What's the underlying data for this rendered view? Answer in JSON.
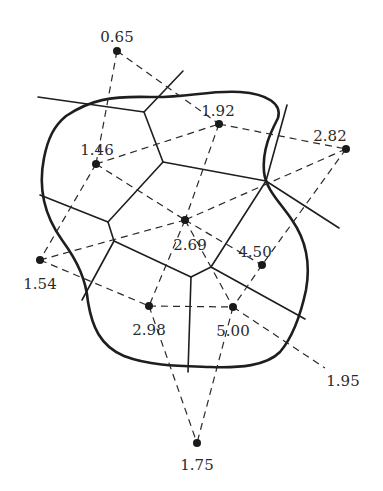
{
  "diagram": {
    "type": "voronoi-thiessen-polygons",
    "points": [
      {
        "id": "p065",
        "label": "0.65",
        "x": 117,
        "y": 51,
        "lx": 117,
        "ly": 38,
        "anchor": "middle"
      },
      {
        "id": "p192",
        "label": "1.92",
        "x": 219,
        "y": 124,
        "lx": 218,
        "ly": 112,
        "anchor": "middle"
      },
      {
        "id": "p282",
        "label": "2.82",
        "x": 346,
        "y": 149,
        "lx": 330,
        "ly": 137,
        "anchor": "middle"
      },
      {
        "id": "p146",
        "label": "1.46",
        "x": 96,
        "y": 164,
        "lx": 97,
        "ly": 151,
        "anchor": "middle"
      },
      {
        "id": "p269",
        "label": "2.69",
        "x": 185,
        "y": 220,
        "lx": 190,
        "ly": 246,
        "anchor": "middle"
      },
      {
        "id": "p154",
        "label": "1.54",
        "x": 40,
        "y": 260,
        "lx": 40,
        "ly": 285,
        "anchor": "middle"
      },
      {
        "id": "p450",
        "label": "4.50",
        "x": 262,
        "y": 265,
        "lx": 255,
        "ly": 253,
        "anchor": "middle"
      },
      {
        "id": "p298",
        "label": "2.98",
        "x": 149,
        "y": 306,
        "lx": 149,
        "ly": 331,
        "anchor": "middle"
      },
      {
        "id": "p500",
        "label": "5.00",
        "x": 233,
        "y": 307,
        "lx": 233,
        "ly": 332,
        "anchor": "middle"
      },
      {
        "id": "p195",
        "label": "1.95",
        "x": 325,
        "y": 368,
        "lx": 343,
        "ly": 382,
        "anchor": "middle"
      },
      {
        "id": "p175",
        "label": "1.75",
        "x": 197,
        "y": 443,
        "lx": 197,
        "ly": 466,
        "anchor": "middle"
      }
    ],
    "triangulation_edges": [
      [
        "p065",
        "p146"
      ],
      [
        "p065",
        "p192"
      ],
      [
        "p146",
        "p192"
      ],
      [
        "p146",
        "p269"
      ],
      [
        "p146",
        "p154"
      ],
      [
        "p192",
        "p282"
      ],
      [
        "p192",
        "p269"
      ],
      [
        "p282",
        "p269"
      ],
      [
        "p282",
        "p450"
      ],
      [
        "p154",
        "p269"
      ],
      [
        "p154",
        "p298"
      ],
      [
        "p269",
        "p298"
      ],
      [
        "p269",
        "p450"
      ],
      [
        "p269",
        "p500"
      ],
      [
        "p298",
        "p500"
      ],
      [
        "p298",
        "p175"
      ],
      [
        "p450",
        "p500"
      ],
      [
        "p500",
        "p175"
      ],
      [
        "p500",
        "p195"
      ]
    ],
    "voronoi_segments": [
      [
        [
          38,
          97
        ],
        [
          144,
          112
        ]
      ],
      [
        [
          144,
          112
        ],
        [
          183,
          71
        ]
      ],
      [
        [
          144,
          112
        ],
        [
          163,
          162
        ]
      ],
      [
        [
          163,
          162
        ],
        [
          266,
          181
        ]
      ],
      [
        [
          163,
          162
        ],
        [
          108,
          222
        ]
      ],
      [
        [
          108,
          222
        ],
        [
          114,
          241
        ]
      ],
      [
        [
          40,
          195
        ],
        [
          108,
          222
        ]
      ],
      [
        [
          114,
          241
        ],
        [
          82,
          300
        ]
      ],
      [
        [
          114,
          241
        ],
        [
          191,
          277
        ]
      ],
      [
        [
          191,
          277
        ],
        [
          211,
          267
        ]
      ],
      [
        [
          211,
          267
        ],
        [
          266,
          181
        ]
      ],
      [
        [
          266,
          181
        ],
        [
          287,
          105
        ]
      ],
      [
        [
          266,
          181
        ],
        [
          339,
          228
        ]
      ],
      [
        [
          211,
          267
        ],
        [
          305,
          319
        ]
      ],
      [
        [
          191,
          277
        ],
        [
          188,
          372
        ]
      ]
    ],
    "boundary_path": "M 66 116 C 90 100, 110 96, 150 97 C 185 98, 210 90, 240 92 C 268 94, 282 104, 278 118 C 272 130, 262 148, 264 172 C 266 190, 280 202, 292 220 C 306 240, 311 262, 306 290 C 300 318, 292 338, 280 352 C 266 366, 240 368, 210 367 C 180 366, 150 366, 124 356 C 100 346, 92 326, 88 302 C 86 280, 78 262, 62 240 C 44 215, 38 188, 44 158 C 48 138, 54 126, 66 116 Z"
  }
}
